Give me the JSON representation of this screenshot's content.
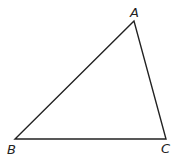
{
  "diagram": {
    "type": "triangle",
    "stroke_color": "#222222",
    "vertices": [
      {
        "label": "A",
        "x": 134,
        "y": 21,
        "lx": 131,
        "ly": 17
      },
      {
        "label": "B",
        "x": 15,
        "y": 139,
        "lx": 7,
        "ly": 153
      },
      {
        "label": "C",
        "x": 166,
        "y": 139,
        "lx": 161,
        "ly": 153
      }
    ]
  }
}
